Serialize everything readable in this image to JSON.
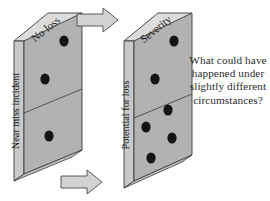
{
  "figure": {
    "background_color": "#ffffff",
    "blocks": [
      {
        "id": "left-block",
        "top_face_label": "No loss",
        "left_face_label": "Near miss incident",
        "front_dot_count": 3,
        "upper_section_dots": 2,
        "lower_section_dots": 1,
        "front_face_color": "#b2b2b2",
        "left_face_color": "#c9c9c9",
        "top_face_color": "#dcdcdc",
        "outline_color": "#3a3a3a"
      },
      {
        "id": "right-block",
        "top_face_label": "Severity",
        "left_face_label": "Potential for loss",
        "front_dot_count": 6,
        "upper_section_dots": 2,
        "lower_section_dots": 4,
        "front_face_color": "#b2b2b2",
        "left_face_color": "#c9c9c9",
        "top_face_color": "#dcdcdc",
        "outline_color": "#3a3a3a"
      }
    ],
    "arrows": [
      {
        "id": "top-arrow",
        "direction": "right",
        "fill": "#d2d2d2",
        "outline": "#4a4a4a"
      },
      {
        "id": "bottom-arrow",
        "direction": "right",
        "fill": "#d2d2d2",
        "outline": "#4a4a4a"
      }
    ],
    "caption": {
      "lines": [
        "What could have",
        "happened under",
        "slightly different",
        "circumstances?"
      ],
      "full_text": "What could have happened under slightly different circumstances?",
      "color": "#2b2b2b"
    },
    "dot_color": "#141414"
  }
}
